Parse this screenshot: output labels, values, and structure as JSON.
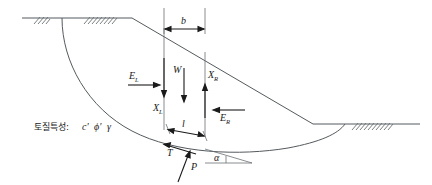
{
  "figure": {
    "type": "slope-stability-slice-diagram",
    "soil_label": {
      "korean": "토질특성:",
      "c": "c'",
      "phi": "ϕ'",
      "gamma": "γ"
    },
    "labels": {
      "b": "b",
      "l": "l",
      "W": "W",
      "EL": "E",
      "EL_sub": "L",
      "ER": "E",
      "ER_sub": "R",
      "XL": "X",
      "XL_sub": "L",
      "XR": "X",
      "XR_sub": "R",
      "T": "T",
      "P": "P",
      "alpha": "α"
    },
    "colors": {
      "ground_line": "#555a5e",
      "slip_surface": "#6b7073",
      "arrow": "#1a1a1a",
      "text": "#1a1a1a",
      "background": "#ffffff"
    }
  }
}
